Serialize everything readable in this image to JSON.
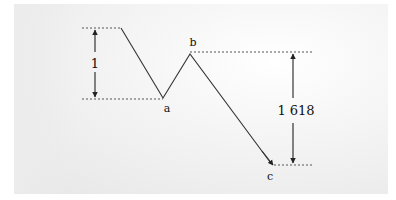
{
  "diagram": {
    "type": "fibonacci-extension-abc",
    "points": {
      "start": {
        "x": 121,
        "y": 28
      },
      "a": {
        "x": 163,
        "y": 98,
        "label": "a"
      },
      "b": {
        "x": 190,
        "y": 54,
        "label": "b"
      },
      "c": {
        "x": 273,
        "y": 165,
        "label": "c"
      }
    },
    "measures": [
      {
        "id": "first-leg",
        "label": "1",
        "x": 95,
        "y_top": 28,
        "y_bottom": 98
      },
      {
        "id": "extension",
        "label": "1 618",
        "x": 293,
        "y_top": 52,
        "y_bottom": 165
      }
    ],
    "colors": {
      "line": "#333333",
      "dotted": "#555555",
      "text": "#111111"
    }
  }
}
